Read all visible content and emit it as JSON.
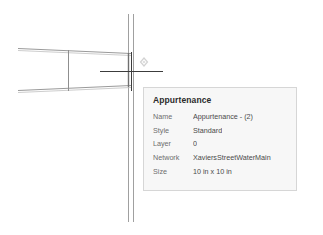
{
  "canvas": {
    "label": "pipe-network-drawing",
    "line_color": "#9a9a9a",
    "crosshair_color": "#3c3c3c",
    "marker_color": "#cfcfcf",
    "background": "#ffffff",
    "elements": {
      "horizontal_pipe": "horizontal-pipe",
      "vertical_pipe": "vertical-pipe",
      "pipe_connector": "pipe-connector-line",
      "crosshair": "cursor-crosshair",
      "snap_marker": "snap-marker-diamond"
    }
  },
  "tooltip": {
    "title": "Appurtenance",
    "rows": [
      {
        "label": "Name",
        "value": "Appurtenance - (2)"
      },
      {
        "label": "Style",
        "value": "Standard"
      },
      {
        "label": "Layer",
        "value": "0"
      },
      {
        "label": "Network",
        "value": "XaviersStreetWaterMain"
      },
      {
        "label": "Size",
        "value": "10 in x 10 in"
      }
    ],
    "colors": {
      "background": "#f7f7f7",
      "border": "#d6d6d6",
      "title_text": "#2b2b2b",
      "label_text": "#6d6d6d",
      "value_text": "#4a4a4a"
    }
  }
}
